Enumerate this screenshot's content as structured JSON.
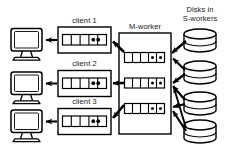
{
  "diagram": {
    "labels": {
      "client1": "client 1",
      "client2": "client 2",
      "client3": "client 3",
      "mworker": "M-worker",
      "disks": "Disks in\nS-workers"
    },
    "colors": {
      "stroke": "#000000",
      "fill": "#ffffff",
      "token": "#000000",
      "background": "#ffffff"
    },
    "clients": [
      {
        "name": "client 1",
        "queue_slots": 5,
        "tokens": 2,
        "token_slots": [
          3,
          4
        ]
      },
      {
        "name": "client 2",
        "queue_slots": 5,
        "tokens": 2,
        "token_slots": [
          3,
          4
        ]
      },
      {
        "name": "client 3",
        "queue_slots": 5,
        "tokens": 2,
        "token_slots": [
          3,
          4
        ]
      }
    ],
    "terminals": [
      {
        "name": "terminal-1"
      },
      {
        "name": "terminal-2"
      },
      {
        "name": "terminal-3"
      }
    ],
    "mworker": {
      "name": "M-worker",
      "queues": [
        {
          "queue_slots": 5,
          "tokens": 2,
          "token_slots": [
            3,
            4
          ]
        },
        {
          "queue_slots": 5,
          "tokens": 2,
          "token_slots": [
            3,
            4
          ]
        },
        {
          "queue_slots": 5,
          "tokens": 2,
          "token_slots": [
            3,
            4
          ]
        }
      ]
    },
    "disks": [
      {
        "name": "disk-1"
      },
      {
        "name": "disk-2"
      },
      {
        "name": "disk-3"
      },
      {
        "name": "disk-4"
      }
    ],
    "arrows": {
      "client_to_terminal": 3,
      "mworker_to_client": 3,
      "disk_to_mworker": 7
    }
  }
}
